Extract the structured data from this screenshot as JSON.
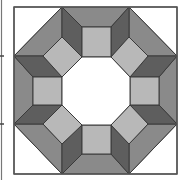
{
  "diagram": {
    "title": "",
    "colors": {
      "background": "#ffffff",
      "outline": "#3a3a3a",
      "medium": "#8a8a8a",
      "dark": "#5e5e5e",
      "light": "#b8b8b8",
      "center": "#ffffff",
      "corner": "#ffffff"
    },
    "neighbor_edge": {
      "x": 1.5,
      "y1": 0,
      "y2": 180,
      "marks": [
        56,
        124
      ]
    },
    "block": {
      "x": 14,
      "y": 7,
      "w": 163,
      "h": 167
    },
    "shapes": [
      {
        "name": "corner-top-left",
        "fill": "corner",
        "points": "14,7 62,7 14,56"
      },
      {
        "name": "corner-top-right",
        "fill": "corner",
        "points": "129,7 177,7 177,56"
      },
      {
        "name": "corner-bottom-right",
        "fill": "corner",
        "points": "177,124 177,174 129,174"
      },
      {
        "name": "corner-bottom-left",
        "fill": "corner",
        "points": "14,124 62,174 14,174"
      },
      {
        "name": "band-top",
        "fill": "medium",
        "points": "62,7 129,7 111,27 82,27"
      },
      {
        "name": "band-bottom",
        "fill": "medium",
        "points": "82,154 111,154 129,174 62,174"
      },
      {
        "name": "band-left",
        "fill": "medium",
        "points": "14,56 33,77 33,105 14,124"
      },
      {
        "name": "band-right",
        "fill": "medium",
        "points": "177,56 177,124 159,105 159,77"
      },
      {
        "name": "band-diag-top-left",
        "fill": "medium",
        "points": "62,7 62,37 43,56 14,56"
      },
      {
        "name": "band-diag-top-right",
        "fill": "medium",
        "points": "129,7 177,56 148,56 129,37"
      },
      {
        "name": "band-diag-bottom-right",
        "fill": "medium",
        "points": "148,124 177,124 129,174 129,144"
      },
      {
        "name": "band-diag-bottom-left",
        "fill": "medium",
        "points": "14,124 43,124 62,144 62,174"
      },
      {
        "name": "dark-top-left-vertical",
        "fill": "dark",
        "points": "62,7 82,27 82,57 62,37"
      },
      {
        "name": "dark-top-right-vertical",
        "fill": "dark",
        "points": "129,7 129,37 111,57 111,27"
      },
      {
        "name": "dark-bottom-left-vertical",
        "fill": "dark",
        "points": "62,144 82,125 82,154 62,174"
      },
      {
        "name": "dark-bottom-right-vertical",
        "fill": "dark",
        "points": "111,125 129,144 129,174 111,154"
      },
      {
        "name": "dark-left-top-horizontal",
        "fill": "dark",
        "points": "14,56 43,56 62,77 33,77"
      },
      {
        "name": "dark-left-bottom-horizontal",
        "fill": "dark",
        "points": "33,105 62,105 43,124 14,124"
      },
      {
        "name": "dark-right-top-horizontal",
        "fill": "dark",
        "points": "148,56 177,56 159,77 130,77"
      },
      {
        "name": "dark-right-bottom-horizontal",
        "fill": "dark",
        "points": "130,105 159,105 177,124 148,124"
      },
      {
        "name": "square-top",
        "fill": "light",
        "points": "82,27 111,27 111,57 82,57"
      },
      {
        "name": "square-bottom",
        "fill": "light",
        "points": "82,125 111,125 111,154 82,154"
      },
      {
        "name": "square-left",
        "fill": "light",
        "points": "33,77 62,77 62,105 33,105"
      },
      {
        "name": "square-right",
        "fill": "light",
        "points": "130,77 159,77 159,105 130,105"
      },
      {
        "name": "diamond-top-left",
        "fill": "light",
        "points": "62,37 82,57 62,77 43,56"
      },
      {
        "name": "diamond-top-right",
        "fill": "light",
        "points": "129,37 148,56 130,77 111,57"
      },
      {
        "name": "diamond-bottom-right",
        "fill": "light",
        "points": "130,105 148,124 129,144 111,125"
      },
      {
        "name": "diamond-bottom-left",
        "fill": "light",
        "points": "62,105 82,125 62,144 43,124"
      },
      {
        "name": "center-octagon",
        "fill": "center",
        "points": "82,57 111,57 130,77 130,105 111,125 82,125 62,105 62,77"
      }
    ]
  }
}
